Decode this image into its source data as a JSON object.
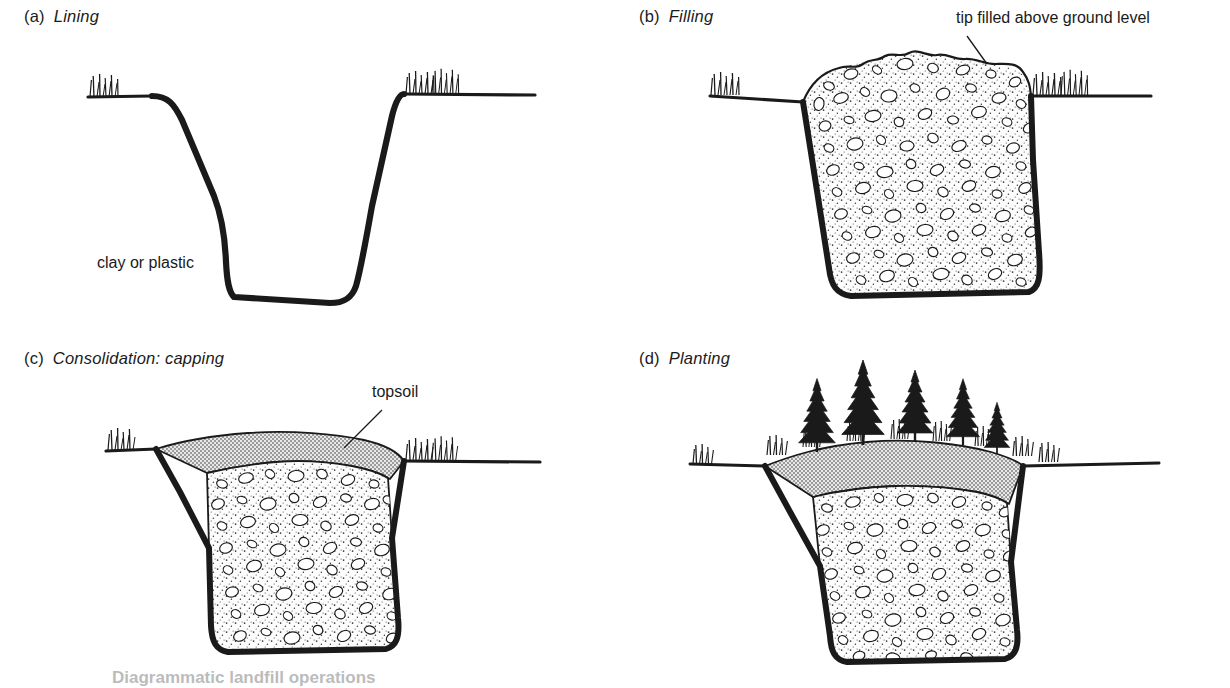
{
  "figure": {
    "title": "Diagrammatic landfill operation",
    "caption": "Diagrammatic landfill operations",
    "background_color": "#ffffff",
    "ink_color": "#1a1a1a",
    "topsoil_fill_color": "#c9c9c9",
    "rubble_fill_color": "#fbfbfb"
  },
  "panels": [
    {
      "id": "a",
      "tag": "(a)",
      "name": "Lining",
      "annotations": [
        {
          "id": "clay-or-plastic",
          "text": "clay or plastic",
          "x": 97,
          "y": 254
        }
      ]
    },
    {
      "id": "b",
      "tag": "(b)",
      "name": "Filling",
      "annotations": [
        {
          "id": "tip-filled-above-ground-level",
          "text": "tip filled above ground level",
          "x": 341,
          "y": 9
        }
      ]
    },
    {
      "id": "c",
      "tag": "(c)",
      "name": "Consolidation: capping",
      "annotations": [
        {
          "id": "topsoil",
          "text": "topsoil",
          "x": 372,
          "y": 41
        }
      ]
    },
    {
      "id": "d",
      "tag": "(d)",
      "name": "Planting",
      "annotations": []
    }
  ],
  "scene_elements": {
    "ground_line": "ground-line",
    "liner": "clay-or-plastic-liner",
    "rubble": "rubble-fill",
    "topsoil_cap": "topsoil-cap",
    "grass": "grass-tuft",
    "trees": "conifer-tree",
    "leader": "leader-line"
  }
}
